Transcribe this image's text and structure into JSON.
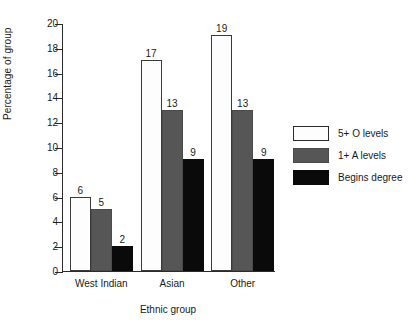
{
  "chart_data": {
    "type": "bar",
    "title": "",
    "subtitle": "",
    "xlabel": "Ethnic group",
    "ylabel": "Percentage of group",
    "categories": [
      "West Indian",
      "Asian",
      "Other"
    ],
    "series": [
      {
        "name": "5+ O levels",
        "values": [
          6,
          17,
          19
        ],
        "color": "#fdfdfd"
      },
      {
        "name": "1+ A levels",
        "values": [
          5,
          13,
          13
        ],
        "color": "#565656"
      },
      {
        "name": "Begins degree",
        "values": [
          2,
          9,
          9
        ],
        "color": "#0a0a0a"
      }
    ],
    "ylim": [
      0,
      20
    ],
    "yticks": [
      0,
      2,
      4,
      6,
      8,
      10,
      12,
      14,
      16,
      18,
      20
    ],
    "ytick_labels": [
      "0",
      "2",
      "4",
      "6",
      "8",
      "10",
      "12",
      "14",
      "16",
      "18",
      "20"
    ],
    "grid": false,
    "legend_position": "right",
    "data_labels": true,
    "bar_value_labels": [
      [
        "6",
        "5",
        "2"
      ],
      [
        "17",
        "13",
        "9"
      ],
      [
        "19",
        "13",
        "9"
      ]
    ]
  },
  "legend": {
    "entries": [
      {
        "label": "5+ O levels",
        "swatch": "swatch-white"
      },
      {
        "label": "1+ A levels",
        "swatch": "swatch-gray"
      },
      {
        "label": "Begins degree",
        "swatch": "swatch-black"
      }
    ]
  }
}
